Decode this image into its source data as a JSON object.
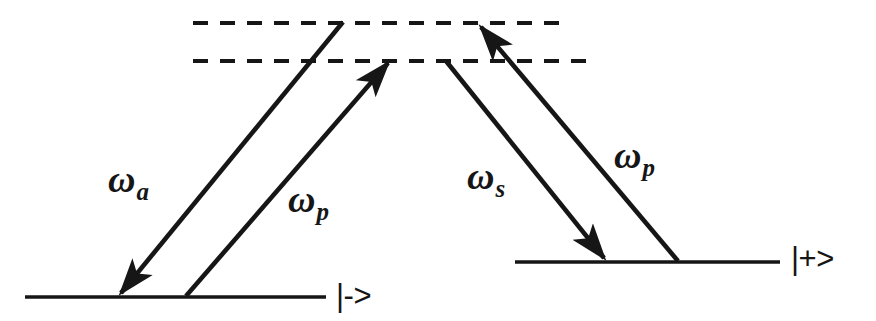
{
  "figure": {
    "kind": "energy-level-diagram",
    "title": "",
    "background_color": "#ffffff",
    "stroke_color": "#161616",
    "width": 876,
    "height": 321
  },
  "levels": [
    {
      "id": "virtual-upper",
      "style": "dashed",
      "label": "",
      "x1": 193,
      "x2": 570,
      "y": 23
    },
    {
      "id": "virtual-lower",
      "style": "dashed",
      "label": "",
      "x1": 193,
      "x2": 592,
      "y": 61
    },
    {
      "id": "dressed-minus",
      "style": "solid",
      "label": "|->",
      "x1": 25,
      "x2": 326,
      "y": 297
    },
    {
      "id": "dressed-plus",
      "style": "solid",
      "label": "|+>",
      "x1": 515,
      "x2": 780,
      "y": 262
    }
  ],
  "transitions": [
    {
      "id": "omega-a",
      "symbol": "ω",
      "subscript": "a",
      "direction": "downward-emission",
      "from": {
        "x": 343,
        "y": 22
      },
      "to": {
        "x": 119,
        "y": 295
      },
      "arrowhead_at": "to",
      "label_x": 108,
      "label_y": 160
    },
    {
      "id": "omega-p-left",
      "symbol": "ω",
      "subscript": "p",
      "direction": "upward-absorption",
      "from": {
        "x": 186,
        "y": 296
      },
      "to": {
        "x": 386,
        "y": 61
      },
      "arrowhead_at": "to",
      "label_x": 247,
      "label_y": 180
    },
    {
      "id": "omega-s",
      "symbol": "ω",
      "subscript": "s",
      "direction": "downward-emission",
      "from": {
        "x": 446,
        "y": 61
      },
      "to": {
        "x": 605,
        "y": 260
      },
      "arrowhead_at": "to",
      "label_x": 467,
      "label_y": 157
    },
    {
      "id": "omega-p-right",
      "symbol": "ω",
      "subscript": "p",
      "direction": "upward-absorption",
      "from": {
        "x": 678,
        "y": 261
      },
      "to": {
        "x": 479,
        "y": 25
      },
      "arrowhead_at": "to",
      "label_x": 612,
      "label_y": 136
    }
  ],
  "ket_labels": [
    {
      "id": "ket-minus",
      "text": "|->",
      "x": 336,
      "y": 280
    },
    {
      "id": "ket-plus",
      "text": "|+>",
      "x": 791,
      "y": 243
    }
  ]
}
